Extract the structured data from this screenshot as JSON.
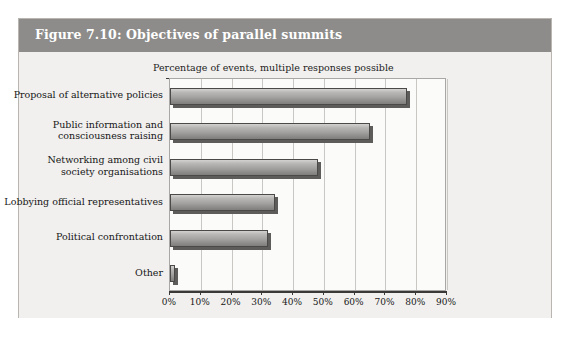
{
  "figure": {
    "title": "Figure 7.10: Objectives of parallel summits",
    "header_color": "#8d8c8a",
    "body_color": "#f1f0ee"
  },
  "chart_data": {
    "type": "bar",
    "orientation": "horizontal",
    "title": "Figure 7.10: Objectives of parallel summits",
    "subtitle": "Percentage of events, multiple responses possible",
    "xlabel": "",
    "ylabel": "",
    "categories": [
      "Proposal of alternative policies",
      "Public information and consciousness raising",
      "Networking among civil society organisations",
      "Lobbying official representatives",
      "Political confrontation",
      "Other"
    ],
    "values": [
      77,
      65,
      48,
      34,
      32,
      1.5
    ],
    "value_unit": "%",
    "xlim": [
      0,
      90
    ],
    "xticks": [
      0,
      10,
      20,
      30,
      40,
      50,
      60,
      70,
      80,
      90
    ],
    "xtick_labels": [
      "0%",
      "10%",
      "20%",
      "30%",
      "40%",
      "50%",
      "60%",
      "70%",
      "80%",
      "90%"
    ],
    "grid": "vertical",
    "legend": "none",
    "bar_style": "3d-shadow-gradient-gray",
    "bar_color": "#a3a2a0"
  },
  "category_lines": [
    [
      "Proposal of alternative policies"
    ],
    [
      "Public information and",
      "consciousness raising"
    ],
    [
      "Networking among civil",
      "society organisations"
    ],
    [
      "Lobbying official representatives"
    ],
    [
      "Political confrontation"
    ],
    [
      "Other"
    ]
  ]
}
